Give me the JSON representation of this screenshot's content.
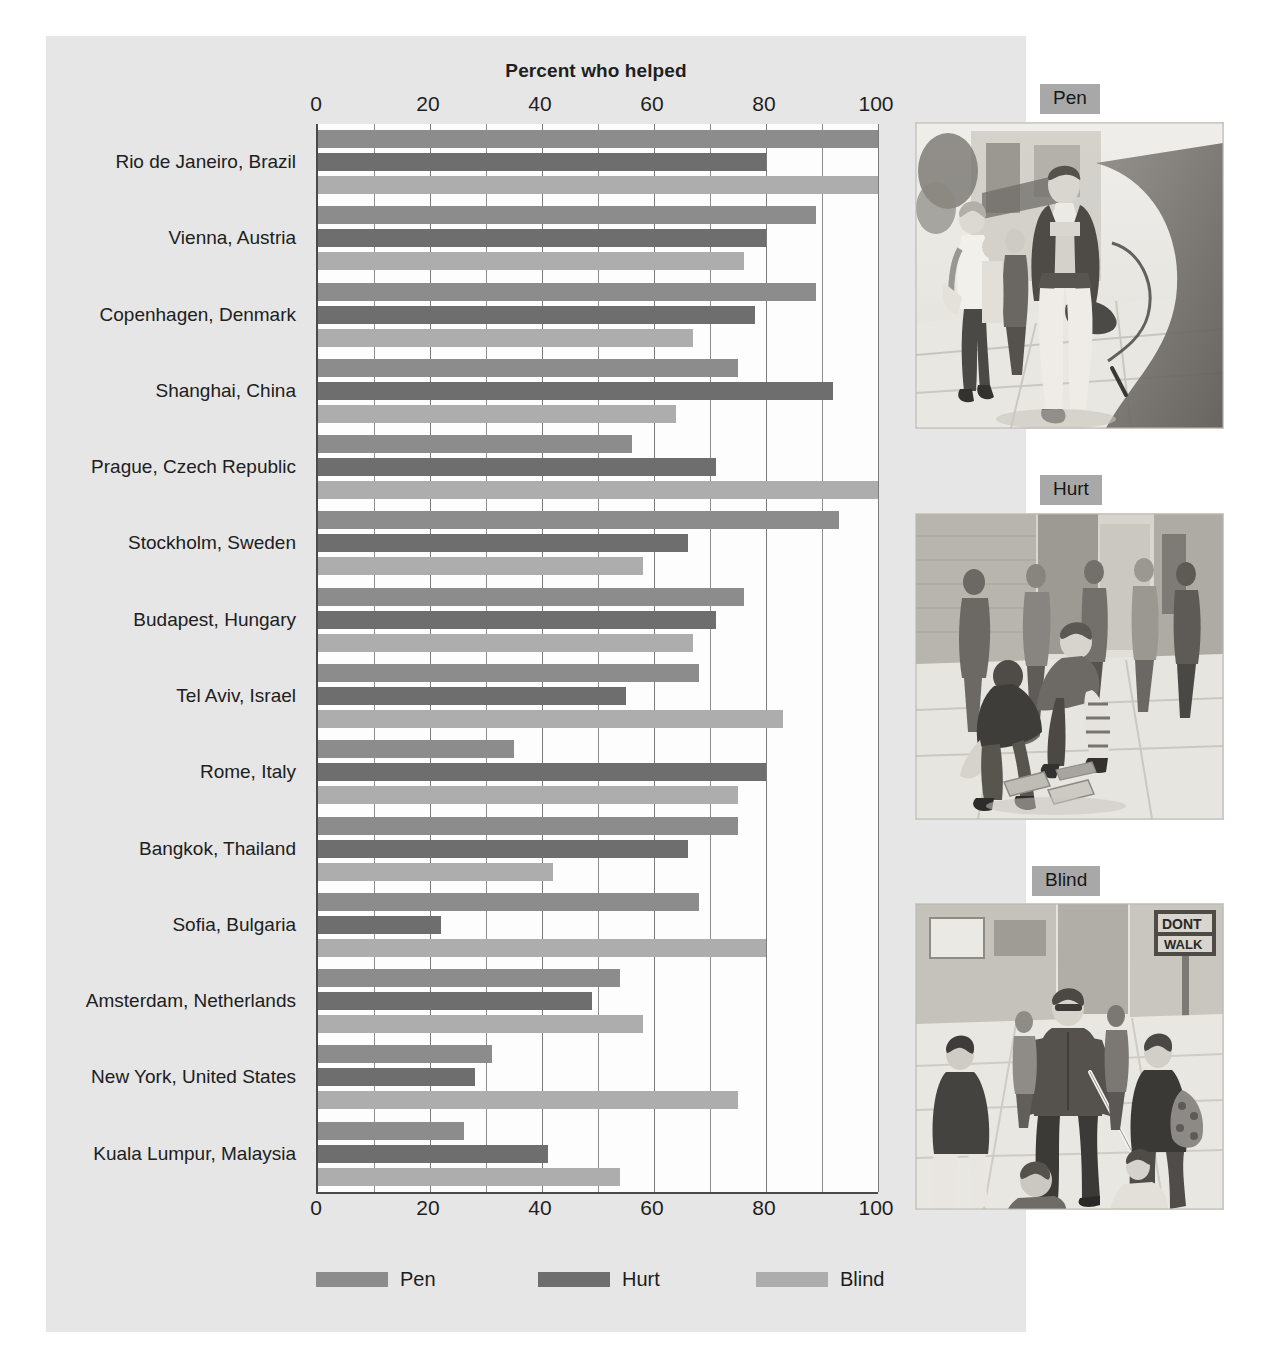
{
  "chart_data": {
    "type": "bar",
    "orientation": "horizontal",
    "title": "Percent who helped",
    "xlabel": "",
    "ylabel": "",
    "xlim": [
      0,
      100
    ],
    "xticks": [
      0,
      20,
      40,
      60,
      80,
      100
    ],
    "minor_gridlines": true,
    "grid": true,
    "legend_position": "bottom",
    "categories": [
      "Rio de Janeiro, Brazil",
      "Vienna, Austria",
      "Copenhagen, Denmark",
      "Shanghai, China",
      "Prague, Czech Republic",
      "Stockholm, Sweden",
      "Budapest, Hungary",
      "Tel Aviv, Israel",
      "Rome, Italy",
      "Bangkok, Thailand",
      "Sofia, Bulgaria",
      "Amsterdam, Netherlands",
      "New York, United States",
      "Kuala Lumpur, Malaysia"
    ],
    "series": [
      {
        "name": "Pen",
        "color": "#8c8c8c",
        "values": [
          100,
          89,
          89,
          75,
          56,
          93,
          76,
          68,
          35,
          75,
          68,
          54,
          31,
          26
        ]
      },
      {
        "name": "Hurt",
        "color": "#6e6e6e",
        "values": [
          80,
          80,
          78,
          92,
          71,
          66,
          71,
          55,
          80,
          66,
          22,
          49,
          28,
          41
        ]
      },
      {
        "name": "Blind",
        "color": "#adadad",
        "values": [
          100,
          76,
          67,
          64,
          100,
          58,
          67,
          83,
          75,
          42,
          80,
          58,
          75,
          54
        ]
      }
    ]
  },
  "legend": {
    "items": [
      {
        "label": "Pen"
      },
      {
        "label": "Hurt"
      },
      {
        "label": "Blind"
      }
    ]
  },
  "illustrations": [
    {
      "tag": "Pen",
      "alt": "Pedestrian dropping a pen on a city sidewalk while others walk by"
    },
    {
      "tag": "Hurt",
      "alt": "Person with an injured leg bending to pick up dropped magazines on a street"
    },
    {
      "tag": "Blind",
      "alt": "Blind man with a white cane crossing at a DONT WALK signal"
    }
  ],
  "colors": {
    "paper": "#e6e6e6",
    "plot_background": "#fdfdfd",
    "axis": "#4a4a4a",
    "gridline": "#8d8d8d",
    "tag_background": "#a8a8a8"
  }
}
